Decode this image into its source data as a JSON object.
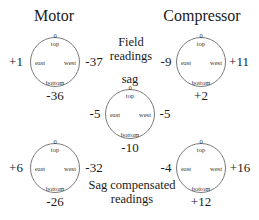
{
  "titles": {
    "motor": "Motor",
    "compressor": "Compressor"
  },
  "captions": {
    "field_line1": "Field",
    "field_line2": "readings",
    "sag": "sag",
    "comp_line1": "Sag compensated",
    "comp_line2": "readings"
  },
  "gauge_labels": {
    "zero": "0",
    "top": "top",
    "east": "east",
    "west": "west",
    "bottom": "bottom"
  },
  "gauges": {
    "motor_field": {
      "east": "+1",
      "west": "-37",
      "bottom": "-36"
    },
    "compressor_field": {
      "east": "-9",
      "west": "+11",
      "bottom": "+2"
    },
    "sag": {
      "east": "-5",
      "west": "-5",
      "bottom": "-10"
    },
    "motor_compensated": {
      "east": "+6",
      "west": "-32",
      "bottom": "-26"
    },
    "compressor_compensated": {
      "east": "-4",
      "west": "+16",
      "bottom": "+12"
    }
  }
}
